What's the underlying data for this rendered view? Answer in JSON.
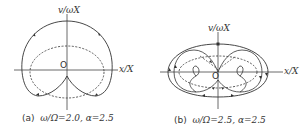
{
  "figure": {
    "panels": [
      {
        "id": "a",
        "caption_prefix": "(a)",
        "caption_math": "ω/Ω=2.0, α=2.5",
        "x_axis_label": "x/X",
        "y_axis_label": "v/ωX",
        "origin_label": "O"
      },
      {
        "id": "b",
        "caption_prefix": "(b)",
        "caption_math": "ω/Ω=2.5, α=2.5",
        "x_axis_label": "x/X",
        "y_axis_label": "v/ωX",
        "origin_label": "O"
      }
    ],
    "colors": {
      "line": "#333333",
      "background": "#ffffff"
    }
  }
}
